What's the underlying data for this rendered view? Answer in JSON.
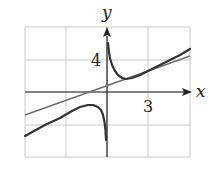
{
  "chart_data": {
    "type": "line",
    "title": "",
    "xlabel": "x",
    "ylabel": "y",
    "x_tick_labels": [
      {
        "value": 3,
        "label": "3"
      }
    ],
    "y_tick_labels": [
      {
        "value": 4,
        "label": "4"
      }
    ],
    "grid": true,
    "grid_step": {
      "x": 3,
      "y": 4
    },
    "xlim": [
      -6,
      6
    ],
    "ylim": [
      -8,
      8
    ],
    "series": [
      {
        "name": "curve (hyperbola with slant asymptote)",
        "style": "dark-thick",
        "branches": [
          {
            "x": [
              -6,
              -4.5,
              -3,
              -2,
              -1.1,
              -0.5,
              -0.2,
              -0.07
            ],
            "y": [
              -5.5,
              -4.1,
              -3.1,
              -2.3,
              -1.6,
              -2.3,
              -3.8,
              -6
            ]
          },
          {
            "x": [
              0.07,
              0.35,
              0.8,
              1.3,
              2.1,
              3,
              4.2,
              6
            ],
            "y": [
              6.1,
              3.4,
              2.1,
              1.6,
              2,
              2.7,
              3.8,
              5.4
            ]
          }
        ]
      },
      {
        "name": "slant asymptote line",
        "style": "gray",
        "x": [
          -6,
          6
        ],
        "y": [
          -2.9,
          4.5
        ]
      }
    ]
  },
  "labels": {
    "x_axis": "x",
    "y_axis": "y",
    "x_tick": "3",
    "y_tick": "4"
  },
  "colors": {
    "grid": "#c8c8c8",
    "axis": "#222222",
    "curve": "#333333",
    "asymptote": "#6e6e6e"
  },
  "pixels": {
    "origin": [
      107,
      92
    ],
    "grid_x": [
      25,
      66,
      107,
      148,
      190
    ],
    "grid_y": [
      27,
      60,
      92,
      125,
      157
    ],
    "curve_left": [
      [
        25,
        136
      ],
      [
        45,
        125
      ],
      [
        60,
        118
      ],
      [
        72,
        111
      ],
      [
        80,
        107
      ],
      [
        88,
        105
      ],
      [
        93,
        105
      ],
      [
        98,
        107
      ],
      [
        101,
        110
      ],
      [
        103,
        115
      ],
      [
        104.5,
        122
      ],
      [
        105.5,
        130
      ],
      [
        106,
        140
      ]
    ],
    "curve_right": [
      [
        108,
        43
      ],
      [
        109,
        52
      ],
      [
        110,
        58
      ],
      [
        112,
        65
      ],
      [
        115,
        71
      ],
      [
        118,
        75
      ],
      [
        122,
        78
      ],
      [
        126,
        79
      ],
      [
        132,
        78
      ],
      [
        140,
        75
      ],
      [
        150,
        70
      ],
      [
        160,
        65
      ],
      [
        170,
        60
      ],
      [
        180,
        55
      ],
      [
        190,
        49
      ]
    ],
    "line": [
      [
        25,
        115
      ],
      [
        190,
        56
      ]
    ]
  }
}
